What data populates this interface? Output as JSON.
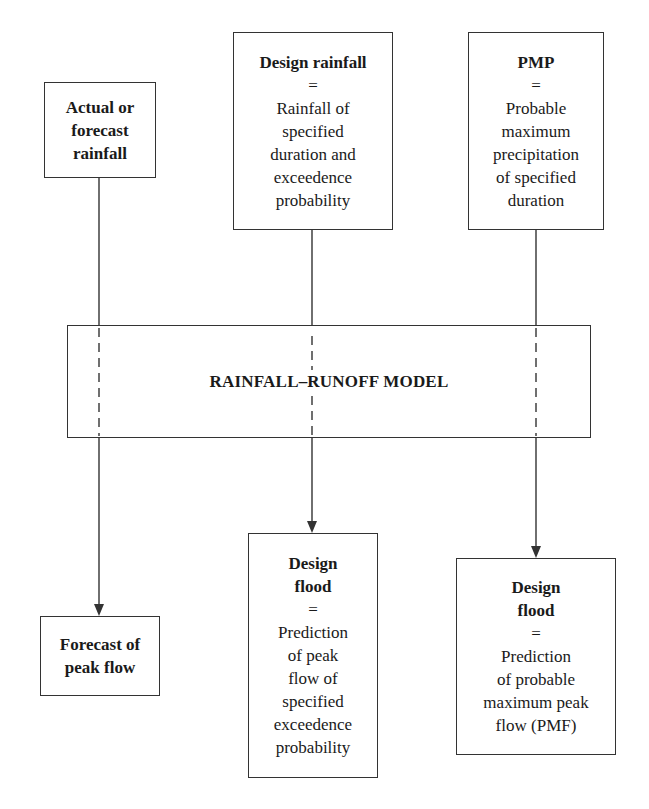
{
  "inputs": [
    {
      "id": "actual-rainfall",
      "title_lines": [
        "Actual or",
        "forecast",
        "rainfall"
      ],
      "eq": "",
      "desc_lines": []
    },
    {
      "id": "design-rainfall",
      "title_lines": [
        "Design rainfall"
      ],
      "eq": "=",
      "desc_lines": [
        "Rainfall of",
        "specified",
        "duration and",
        "exceedence",
        "probability"
      ]
    },
    {
      "id": "pmp",
      "title_lines": [
        "PMP"
      ],
      "eq": "=",
      "desc_lines": [
        "Probable",
        "maximum",
        "precipitation",
        "of specified",
        "duration"
      ]
    }
  ],
  "model": {
    "label": "RAINFALL–RUNOFF MODEL"
  },
  "outputs": [
    {
      "id": "forecast-peak-flow",
      "title_lines": [
        "Forecast of",
        "peak flow"
      ],
      "eq": "",
      "desc_lines": []
    },
    {
      "id": "design-flood-exceedence",
      "title_lines": [
        "Design",
        "flood"
      ],
      "eq": "=",
      "desc_lines": [
        "Prediction",
        "of peak",
        "flow of",
        "specified",
        "exceedence",
        "probability"
      ]
    },
    {
      "id": "design-flood-pmf",
      "title_lines": [
        "Design",
        "flood"
      ],
      "eq": "=",
      "desc_lines": [
        "Prediction",
        "of probable",
        "maximum peak",
        "flow (PMF)"
      ]
    }
  ],
  "colors": {
    "line": "#333333",
    "text": "#1a1a1a",
    "background": "#ffffff"
  }
}
